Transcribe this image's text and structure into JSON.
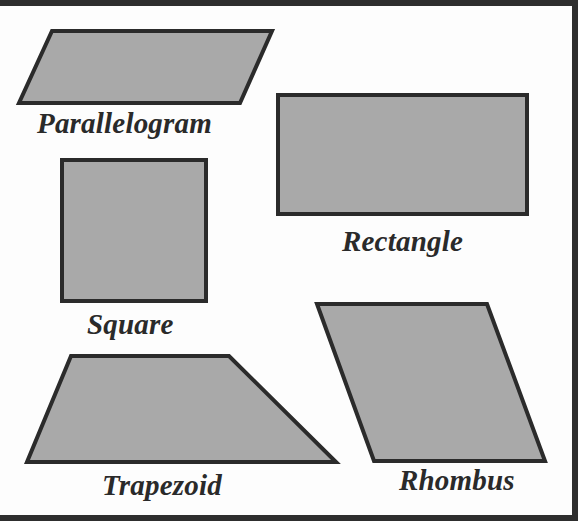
{
  "diagram": {
    "title": "",
    "colors": {
      "shape_fill": "#a9a9a9",
      "shape_stroke": "#2b2b2b",
      "frame": "#2e2e2e",
      "background": "#fdfdfd",
      "label_text": "#2a2a2a"
    },
    "shapes": [
      {
        "id": "parallelogram",
        "label": "Parallelogram",
        "type": "polygon",
        "points": "52,31 272,31 240,103 19,103"
      },
      {
        "id": "rectangle",
        "label": "Rectangle",
        "type": "polygon",
        "points": "278,95 527,95 527,214 278,214"
      },
      {
        "id": "square",
        "label": "Square",
        "type": "polygon",
        "points": "62,160 206,160 206,301 62,301"
      },
      {
        "id": "trapezoid",
        "label": "Trapezoid",
        "type": "polygon",
        "points": "71,356 229,356 336,462 27,462"
      },
      {
        "id": "rhombus",
        "label": "Rhombus",
        "type": "polygon",
        "points": "317,304 487,304 545,461 374,461"
      }
    ]
  }
}
